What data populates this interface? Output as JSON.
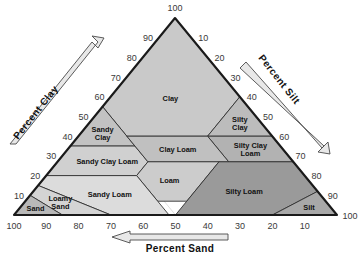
{
  "chart_data": {
    "type": "diagram",
    "axes": {
      "clay": {
        "label": "Percent Clay",
        "ticks": [
          10,
          20,
          30,
          40,
          50,
          60,
          70,
          80,
          90,
          100
        ],
        "direction": "up-right",
        "corner_label": "100"
      },
      "silt": {
        "label": "Percent Silt",
        "ticks": [
          10,
          20,
          30,
          40,
          50,
          60,
          70,
          80,
          90,
          100
        ],
        "direction": "down-right",
        "corner_label": "100"
      },
      "sand": {
        "label": "Percent Sand",
        "ticks": [
          100,
          90,
          80,
          70,
          60,
          50,
          40,
          30,
          20,
          10,
          100
        ],
        "direction": "left",
        "corner_label": "100"
      }
    },
    "grid": true,
    "grid_step": 10,
    "regions": [
      {
        "name": "Clay",
        "label": "Clay",
        "lines": [
          "Clay"
        ],
        "fill": "#c9c9c9",
        "vertices": [
          [
            0,
            100,
            0
          ],
          [
            0,
            60,
            40
          ],
          [
            20,
            40,
            40
          ],
          [
            45,
            40,
            15
          ],
          [
            45,
            55,
            0
          ]
        ]
      },
      {
        "name": "Silty Clay",
        "label": "Silty Clay",
        "lines": [
          "Silty",
          "Clay"
        ],
        "fill": "#bcbcbc",
        "vertices": [
          [
            0,
            60,
            40
          ],
          [
            0,
            40,
            60
          ],
          [
            20,
            40,
            40
          ]
        ]
      },
      {
        "name": "Silty Clay Loam",
        "label": "Silty Clay Loam",
        "lines": [
          "Silty Clay",
          "Loam"
        ],
        "fill": "#b2b2b2",
        "vertices": [
          [
            0,
            40,
            60
          ],
          [
            0,
            27,
            73
          ],
          [
            20,
            27,
            53
          ],
          [
            20,
            40,
            40
          ]
        ]
      },
      {
        "name": "Sandy Clay",
        "label": "Sandy Clay",
        "lines": [
          "Sandy",
          "Clay"
        ],
        "fill": "#c2c2c2",
        "vertices": [
          [
            45,
            55,
            0
          ],
          [
            45,
            35,
            20
          ],
          [
            65,
            35,
            0
          ]
        ]
      },
      {
        "name": "Sandy Clay Loam",
        "label": "Sandy Clay Loam",
        "lines": [
          "Sandy Clay Loam"
        ],
        "fill": "#d0d0d0",
        "vertices": [
          [
            45,
            35,
            20
          ],
          [
            45,
            27,
            28
          ],
          [
            52,
            20,
            28
          ],
          [
            80,
            20,
            0
          ],
          [
            65,
            35,
            0
          ]
        ]
      },
      {
        "name": "Clay Loam",
        "label": "Clay Loam",
        "lines": [
          "Clay Loam"
        ],
        "fill": "#c0c0c0",
        "vertices": [
          [
            20,
            40,
            40
          ],
          [
            20,
            27,
            53
          ],
          [
            45,
            27,
            28
          ],
          [
            45,
            40,
            15
          ]
        ]
      },
      {
        "name": "Loam",
        "label": "Loam",
        "lines": [
          "Loam"
        ],
        "fill": "#cccccc",
        "vertices": [
          [
            23,
            27,
            50
          ],
          [
            45,
            27,
            28
          ],
          [
            52,
            20,
            28
          ],
          [
            52,
            7,
            41
          ],
          [
            43,
            7,
            50
          ]
        ]
      },
      {
        "name": "Silty Loam",
        "label": "Silty Loam",
        "lines": [
          "Silty Loam"
        ],
        "fill": "#9a9a9a",
        "vertices": [
          [
            0,
            27,
            73
          ],
          [
            0,
            12,
            88
          ],
          [
            20,
            0,
            80
          ],
          [
            50,
            0,
            50
          ],
          [
            43,
            7,
            50
          ],
          [
            23,
            27,
            50
          ]
        ]
      },
      {
        "name": "Silt",
        "label": "Silt",
        "lines": [
          "Silt"
        ],
        "fill": "#a8a8a8",
        "vertices": [
          [
            0,
            12,
            88
          ],
          [
            0,
            0,
            100
          ],
          [
            20,
            0,
            80
          ]
        ]
      },
      {
        "name": "Sandy Loam",
        "label": "Sandy Loam",
        "lines": [
          "Sandy Loam"
        ],
        "fill": "#dcdcdc",
        "vertices": [
          [
            52,
            20,
            28
          ],
          [
            80,
            20,
            0
          ],
          [
            85,
            15,
            0
          ],
          [
            70,
            0,
            30
          ],
          [
            52,
            0,
            48
          ],
          [
            52,
            7,
            41
          ]
        ]
      },
      {
        "name": "Loamy Sand",
        "label": "Loamy Sand",
        "lines": [
          "Loamy",
          "Sand"
        ],
        "fill": "#d4d4d4",
        "vertices": [
          [
            85,
            15,
            0
          ],
          [
            90,
            10,
            0
          ],
          [
            85,
            0,
            15
          ],
          [
            70,
            0,
            30
          ]
        ]
      },
      {
        "name": "Sand",
        "label": "Sand",
        "lines": [
          "Sand"
        ],
        "fill": "#b8b8b8",
        "vertices": [
          [
            90,
            10,
            0
          ],
          [
            100,
            0,
            0
          ],
          [
            85,
            0,
            15
          ]
        ]
      }
    ]
  },
  "labels": {
    "clay_axis": "Percent Clay",
    "silt_axis": "Percent Silt",
    "sand_axis": "Percent Sand",
    "apex": "100",
    "bottom_left": "100",
    "bottom_right": "100"
  },
  "colors": {
    "background": "#ffffff",
    "outline": "#1a1a1a",
    "grid": "#bdbdbd",
    "region_border": "#2b2b2b",
    "tick_text": "#3a3a3a",
    "label_text": "#111111",
    "arrow_fill": "#e8e8e8",
    "arrow_stroke": "#4a4a4a"
  }
}
